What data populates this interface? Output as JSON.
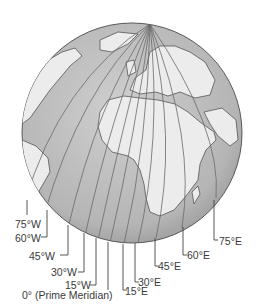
{
  "diagram": {
    "colors": {
      "ocean": "#bdbdbd",
      "land": "#ececec",
      "outline": "#5a5a5a",
      "meridian": "#6a6a6a",
      "label": "#3a3a3a"
    },
    "labels": [
      {
        "id": "75w",
        "text": "75°W"
      },
      {
        "id": "60w",
        "text": "60°W"
      },
      {
        "id": "45w",
        "text": "45°W"
      },
      {
        "id": "30w",
        "text": "30°W"
      },
      {
        "id": "15w",
        "text": "15°W"
      },
      {
        "id": "0",
        "text": "0° (Prime Meridian)"
      },
      {
        "id": "15e",
        "text": "15°E"
      },
      {
        "id": "30e",
        "text": "30°E"
      },
      {
        "id": "45e",
        "text": "45°E"
      },
      {
        "id": "60e",
        "text": "60°E"
      },
      {
        "id": "75e",
        "text": "75°E"
      }
    ]
  }
}
